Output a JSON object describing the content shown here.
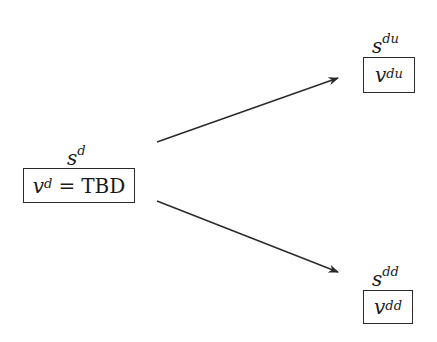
{
  "nodes": {
    "root": {
      "state_label": "s",
      "state_sup": "d",
      "value_var": "v",
      "value_sup": "d",
      "equals": "=",
      "value": "TBD"
    },
    "up": {
      "state_label": "s",
      "state_sup": "du",
      "value_var": "v",
      "value_sup": "du"
    },
    "down": {
      "state_label": "s",
      "state_sup": "dd",
      "value_var": "v",
      "value_sup": "dd"
    }
  },
  "edges": [
    {
      "from": "root",
      "to": "up"
    },
    {
      "from": "root",
      "to": "down"
    }
  ],
  "colors": {
    "stroke": "#2a2a2a",
    "background": "#ffffff"
  }
}
